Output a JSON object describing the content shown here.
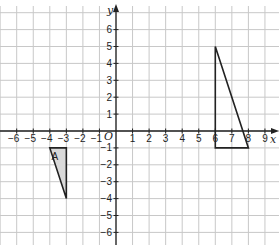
{
  "diagram": {
    "type": "coordinate-grid",
    "x_axis": {
      "label": "x",
      "min": -7,
      "max": 9,
      "ticks": [
        -6,
        -5,
        -4,
        -3,
        -2,
        -1,
        1,
        2,
        3,
        4,
        5,
        6,
        7,
        8,
        9
      ]
    },
    "y_axis": {
      "label": "y",
      "min": -7,
      "max": 6,
      "ticks": [
        6,
        5,
        4,
        3,
        2,
        1,
        -1,
        -2,
        -3,
        -4,
        -5,
        -6
      ]
    },
    "origin_label": "O",
    "colors": {
      "grid": "#c8c8c8",
      "axis": "#222222",
      "shape_stroke": "#222222",
      "shape_fill": "#d9d9d9"
    },
    "shapes": [
      {
        "name": "A",
        "label": "A",
        "vertices": [
          [
            -4,
            -1
          ],
          [
            -3,
            -1
          ],
          [
            -3,
            -4
          ]
        ],
        "filled": true
      },
      {
        "name": "image",
        "label": "",
        "vertices": [
          [
            6,
            5
          ],
          [
            6,
            -1
          ],
          [
            8,
            -1
          ]
        ],
        "filled": false
      }
    ]
  }
}
